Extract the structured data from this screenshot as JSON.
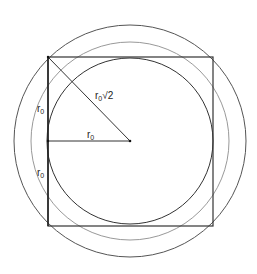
{
  "diagram": {
    "labels": {
      "diagonal": {
        "base": "r",
        "sub": "0",
        "suffix": "√2"
      },
      "radius": {
        "base": "r",
        "sub": "0"
      },
      "side_upper": {
        "base": "r",
        "sub": "0"
      },
      "side_lower": {
        "base": "r",
        "sub": "0"
      }
    },
    "colors": {
      "square": "#333333",
      "inner_circle": "#333333",
      "middle_circle": "#888888",
      "outer_circle": "#555555"
    }
  }
}
